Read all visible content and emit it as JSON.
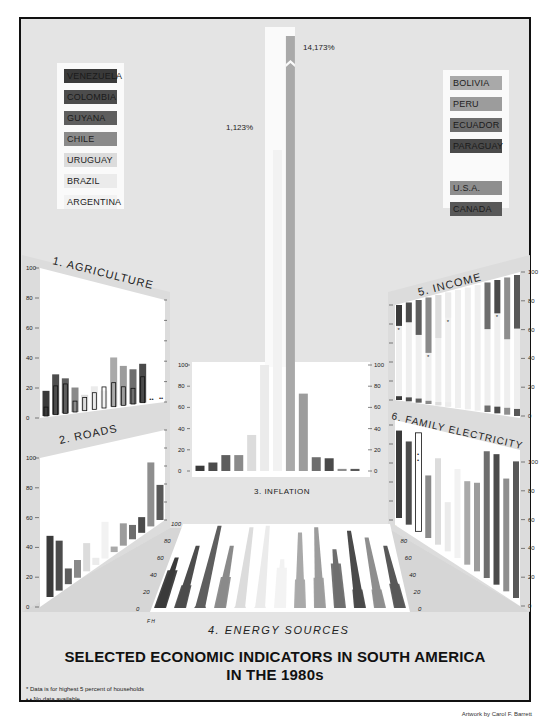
{
  "title_line1": "SELECTED ECONOMIC INDICATORS IN SOUTH AMERICA",
  "title_line2": "IN THE 1980s",
  "notes": {
    "star": "* Data is for highest 5 percent of households",
    "nodata": "• • No data available"
  },
  "credit": "Artwork by Carol F. Barrett",
  "legend_left": [
    {
      "label": "VENEZUELA",
      "color": "#3a3a3a"
    },
    {
      "label": "COLOMBIA",
      "color": "#4c4c4c"
    },
    {
      "label": "GUYANA",
      "color": "#5e5e5e"
    },
    {
      "label": "CHILE",
      "color": "#8a8a8a"
    },
    {
      "label": "URUGUAY",
      "color": "#dcdcdc"
    },
    {
      "label": "BRAZIL",
      "color": "#ebebeb"
    },
    {
      "label": "ARGENTINA",
      "color": "#f2f2f2"
    }
  ],
  "legend_right": [
    {
      "label": "BOLIVIA",
      "color": "#a9a9a9"
    },
    {
      "label": "PERU",
      "color": "#9c9c9c"
    },
    {
      "label": "ECUADOR",
      "color": "#6e6e6e"
    },
    {
      "label": "PARAGUAY",
      "color": "#4a4a4a"
    },
    {
      "label": "U.S.A.",
      "color": "#8e8e8e"
    },
    {
      "label": "CANADA",
      "color": "#585858"
    }
  ],
  "panel_titles": {
    "agriculture": "1. AGRICULTURE",
    "roads": "2. ROADS",
    "inflation": "3. INFLATION",
    "energy": "4. ENERGY SOURCES",
    "income": "5. INCOME",
    "electricity": "6. FAMILY ELECTRICITY"
  },
  "inflation_callouts": {
    "high": "14,173%",
    "mid": "1,123%"
  },
  "energy_axis_label": "F H",
  "axis_ticks": [
    "0",
    "20",
    "40",
    "60",
    "80",
    "100"
  ],
  "chart_data": [
    {
      "type": "bar",
      "title": "1. AGRICULTURE",
      "ylim": [
        0,
        100
      ],
      "categories": [
        "Venezuela",
        "Colombia",
        "Guyana",
        "Chile",
        "Uruguay",
        "Brazil",
        "Argentina",
        "Bolivia",
        "Peru",
        "Ecuador",
        "Paraguay",
        "U.S.A.",
        "Canada"
      ],
      "series": [
        {
          "name": "Total",
          "values": [
            17,
            28,
            25,
            18,
            12,
            18,
            14,
            41,
            34,
            31,
            36,
            null,
            null
          ]
        },
        {
          "name": "Outlined inner",
          "values": [
            6,
            20,
            21,
            8,
            10,
            13,
            17,
            20,
            16,
            14,
            24,
            null,
            null
          ]
        }
      ],
      "note": "U.S.A. and Canada: no data (••)"
    },
    {
      "type": "bar",
      "title": "2. ROADS",
      "ylim": [
        0,
        100
      ],
      "categories": [
        "Venezuela",
        "Colombia",
        "Guyana",
        "Chile",
        "Uruguay",
        "Brazil",
        "Argentina",
        "Bolivia",
        "Peru",
        "Ecuador",
        "Paraguay",
        "U.S.A.",
        "Canada"
      ],
      "values": [
        44,
        37,
        12,
        14,
        23,
        6,
        32,
        5,
        21,
        14,
        16,
        68,
        39
      ]
    },
    {
      "type": "bar",
      "title": "3. INFLATION",
      "ylim": [
        0,
        100
      ],
      "categories": [
        "Venezuela",
        "Colombia",
        "Guyana",
        "Chile",
        "Uruguay",
        "Brazil",
        "Argentina",
        "Bolivia",
        "Peru",
        "Ecuador",
        "Paraguay",
        "U.S.A.",
        "Canada"
      ],
      "values": [
        5,
        8,
        15,
        15,
        34,
        100,
        1123,
        14173,
        73,
        13,
        12,
        2,
        2
      ],
      "annotations": [
        "14,173%",
        "1,123%"
      ]
    },
    {
      "type": "bar",
      "title": "4. ENERGY SOURCES",
      "ylim": [
        0,
        100
      ],
      "categories": [
        "Venezuela",
        "Colombia",
        "Guyana",
        "Chile",
        "Uruguay",
        "Brazil",
        "Argentina",
        "Bolivia",
        "Peru",
        "Ecuador",
        "Paraguay",
        "U.S.A.",
        "Canada"
      ],
      "series": [
        {
          "name": "F",
          "values": [
            60,
            74,
            98,
            74,
            96,
            98,
            58,
            90,
            96,
            70,
            92,
            84,
            74
          ]
        },
        {
          "name": "H",
          "values": [
            45,
            27,
            2,
            37,
            2,
            2,
            48,
            34,
            36,
            53,
            22,
            22,
            29
          ]
        }
      ]
    },
    {
      "type": "bar",
      "title": "5. INCOME",
      "ylim": [
        0,
        100
      ],
      "categories": [
        "Venezuela",
        "Colombia",
        "Guyana",
        "Chile",
        "Uruguay",
        "Brazil",
        "Argentina",
        "Bolivia",
        "Peru",
        "Ecuador",
        "Paraguay",
        "U.S.A.",
        "Canada"
      ],
      "series": [
        {
          "name": "Top share",
          "values": [
            22,
            20,
            34,
            52,
            39,
            22,
            null,
            null,
            null,
            36,
            25,
            45,
            38
          ]
        },
        {
          "name": "Bottom share",
          "values": [
            4,
            4,
            4,
            3,
            3,
            4,
            null,
            null,
            null,
            5,
            5,
            5,
            5
          ]
        }
      ],
      "note": "* marks data for highest 5 percent of households"
    },
    {
      "type": "bar",
      "title": "6. FAMILY ELECTRICITY",
      "ylim": [
        0,
        100
      ],
      "categories": [
        "Venezuela",
        "Colombia",
        "Guyana",
        "Chile",
        "Uruguay",
        "Brazil",
        "Argentina",
        "Bolivia",
        "Peru",
        "Ecuador",
        "Paraguay",
        "U.S.A.",
        "Canada"
      ],
      "values": [
        94,
        86,
        null,
        60,
        80,
        44,
        77,
        70,
        72,
        100,
        100,
        84,
        99
      ],
      "note": "Guyana: no data (••)"
    }
  ]
}
